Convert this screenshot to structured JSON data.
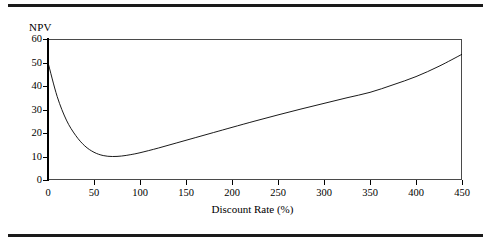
{
  "figure": {
    "y_axis_title": "NPV",
    "x_axis_title": "Discount Rate (%)"
  },
  "chart_data": {
    "type": "line",
    "title": "",
    "xlabel": "Discount Rate (%)",
    "ylabel": "NPV",
    "xlim": [
      0,
      450
    ],
    "ylim": [
      0,
      60
    ],
    "xticks": [
      0,
      50,
      100,
      150,
      200,
      250,
      300,
      350,
      400,
      450
    ],
    "xtick_labels": [
      "0",
      "50",
      "100",
      "150",
      "200",
      "250",
      "300",
      "350",
      "400",
      "450"
    ],
    "yticks": [
      0,
      10,
      20,
      30,
      40,
      50,
      60
    ],
    "ytick_labels": [
      "0",
      "10",
      "20",
      "30",
      "40",
      "50",
      "60"
    ],
    "grid": false,
    "legend": false,
    "line_color": "#000000",
    "line_width": 0.9,
    "series": [
      {
        "name": "NPV",
        "x": [
          0,
          10,
          20,
          30,
          40,
          50,
          60,
          70,
          80,
          90,
          100,
          120,
          140,
          160,
          180,
          200,
          225,
          250,
          275,
          300,
          325,
          350,
          375,
          400,
          425,
          450
        ],
        "y": [
          50.0,
          35.5,
          25.5,
          19.0,
          14.5,
          11.8,
          10.4,
          10.0,
          10.2,
          10.8,
          11.6,
          13.6,
          15.8,
          18.0,
          20.2,
          22.4,
          25.1,
          27.7,
          30.2,
          32.6,
          35.0,
          37.3,
          40.5,
          44.0,
          48.4,
          53.5
        ]
      }
    ],
    "annotations": {
      "start_point": "NPV = 50 at 0%",
      "minimum_point": "NPV = 10 at approximately 70%",
      "end_point": "NPV = 53.5 at 450%"
    }
  }
}
